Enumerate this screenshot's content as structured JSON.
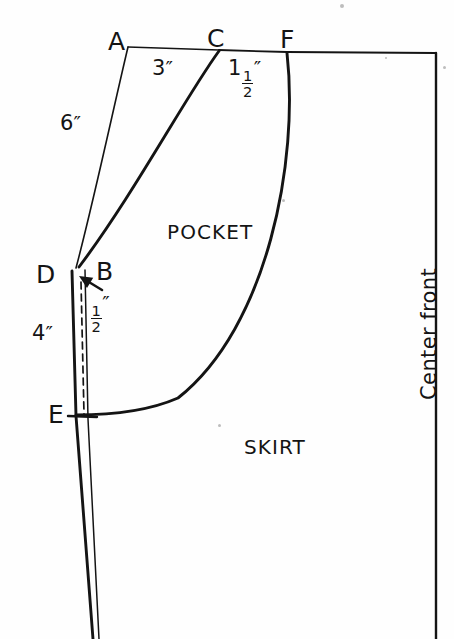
{
  "figure": {
    "background_color": "#fefefe",
    "line_color": "#141414"
  },
  "points": [
    {
      "id": "A",
      "label": "A",
      "x": 128,
      "y": 47
    },
    {
      "id": "C",
      "label": "C",
      "x": 219,
      "y": 50
    },
    {
      "id": "F",
      "label": "F",
      "x": 287,
      "y": 52
    },
    {
      "id": "D",
      "label": "D",
      "x": 72,
      "y": 272
    },
    {
      "id": "B",
      "label": "B",
      "x": 85,
      "y": 268
    },
    {
      "id": "E",
      "label": "E",
      "x": 76,
      "y": 415
    }
  ],
  "point_labels": [
    {
      "name": "point-label-a",
      "text": "A",
      "x": 108,
      "y": 29
    },
    {
      "name": "point-label-c",
      "text": "C",
      "x": 207,
      "y": 26
    },
    {
      "name": "point-label-f",
      "text": "F",
      "x": 280,
      "y": 27
    },
    {
      "name": "point-label-d",
      "text": "D",
      "x": 36,
      "y": 262
    },
    {
      "name": "point-label-b",
      "text": "B",
      "x": 96,
      "y": 259
    },
    {
      "name": "point-label-e",
      "text": "E",
      "x": 48,
      "y": 402
    }
  ],
  "dimensions": [
    {
      "name": "dimension-6-inch",
      "whole": "6",
      "fraction": null,
      "unit": "″",
      "x": 60,
      "y": 113,
      "segment": "A–D"
    },
    {
      "name": "dimension-3-inch",
      "whole": "3",
      "fraction": null,
      "unit": "″",
      "x": 152,
      "y": 58,
      "segment": "A–C"
    },
    {
      "name": "dimension-1-and-half-inch",
      "whole": "1",
      "fraction": {
        "numerator": "1",
        "denominator": "2"
      },
      "unit": "″",
      "x": 228,
      "y": 58,
      "segment": "C–F"
    },
    {
      "name": "dimension-half-inch",
      "whole": "",
      "fraction": {
        "numerator": "1",
        "denominator": "2"
      },
      "unit": "″",
      "x": 90,
      "y": 293,
      "segment": "D–B"
    },
    {
      "name": "dimension-4-inch",
      "whole": "4",
      "fraction": null,
      "unit": "″",
      "x": 32,
      "y": 323,
      "segment": "D–E"
    }
  ],
  "region_labels": [
    {
      "name": "region-label-pocket",
      "text": "POCKET",
      "x": 167,
      "y": 222
    },
    {
      "name": "region-label-skirt",
      "text": "SKIRT",
      "x": 244,
      "y": 437
    }
  ],
  "edge_labels": [
    {
      "name": "center-front-label",
      "text": "Center front",
      "x": 419,
      "y": 400,
      "rotation": -90
    }
  ],
  "paths": {
    "waistline_a_to_c": {
      "name": "waistline-segment-ac",
      "d": "M 128 47 L 219 50",
      "width": 1.6
    },
    "waistline_c_to_f": {
      "name": "waistline-segment-cf",
      "d": "M 219 50 L 287 52",
      "width": 1.8
    },
    "waistline_f_to_right": {
      "name": "waistline-segment-f-to-center-front",
      "d": "M 287 52 L 436 53",
      "width": 1.8
    },
    "side_seam_a_to_d": {
      "name": "side-seam-curve-ad",
      "d": "M 128 47 C 113 110, 94 200, 76 268",
      "width": 1.6
    },
    "pocket_opening_c_to_d": {
      "name": "pocket-opening-curve-cd",
      "d": "M 219 51 C 186 96, 134 194, 79 267",
      "width": 2.9
    },
    "pocket_seam_f_to_e": {
      "name": "pocket-seam-curve-fe",
      "d": "M 287 53 C 299 160, 268 327, 178 398 C 146 412, 108 415, 76 415",
      "width": 2.9
    },
    "left_edge_d_to_e": {
      "name": "left-edge-de",
      "d": "M 72 271 L 76 416",
      "width": 2.9
    },
    "left_edge_e_to_bottom": {
      "name": "left-edge-e-to-hem",
      "d": "M 76 416 L 93 639",
      "width": 2.9
    },
    "inner_line_b_to_bottom": {
      "name": "inner-line-b-to-hem",
      "d": "M 85 270 L 88 419 L 99 639",
      "width": 1.5
    },
    "center_front_line": {
      "name": "center-front-line",
      "d": "M 436 53 L 436 639",
      "width": 2.4
    },
    "dart_dashed": {
      "name": "dart-dashed-line",
      "d": "M 81 282 L 84 414",
      "width": 1.7,
      "dash": "7 5"
    },
    "hem_tick_at_e": {
      "name": "hem-tick-at-e",
      "d": "M 68 416 L 97 417",
      "width": 2.4
    }
  },
  "arrow": {
    "name": "half-inch-pointer-arrow",
    "tip_x": 79,
    "tip_y": 276,
    "tail_x": 102,
    "tail_y": 290
  },
  "specks": [
    {
      "name": "paper-speck",
      "x": 340,
      "y": 4,
      "size": 4
    },
    {
      "name": "paper-speck",
      "x": 282,
      "y": 199,
      "size": 3
    },
    {
      "name": "paper-speck",
      "x": 218,
      "y": 424,
      "size": 3
    },
    {
      "name": "paper-speck",
      "x": 443,
      "y": 66,
      "size": 3
    },
    {
      "name": "paper-speck",
      "x": 385,
      "y": 57,
      "size": 2
    }
  ]
}
